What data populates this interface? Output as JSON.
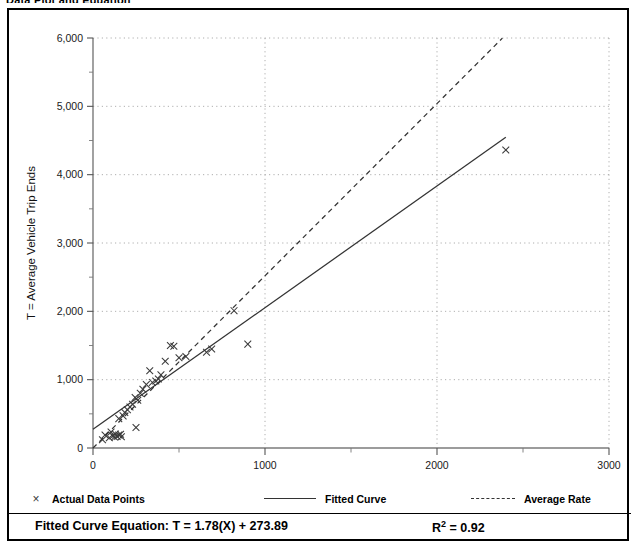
{
  "page": {
    "top_caption": "Data Plot and Equation"
  },
  "legend": {
    "entries": [
      {
        "label": "Actual Data Points",
        "style": "marker",
        "glyph": "×",
        "color": "#3a3a3a"
      },
      {
        "label": "Fitted Curve",
        "style": "solid",
        "color": "#333333"
      },
      {
        "label": "Average Rate",
        "style": "dashed",
        "color": "#333333"
      }
    ]
  },
  "equation": {
    "text": "Fitted Curve Equation:  T = 1.78(X) + 273.89",
    "r_squared_symbol": "R",
    "r_squared_exponent": "2",
    "r_squared_value": "= 0.92"
  },
  "chart_data": {
    "type": "scatter",
    "title": "",
    "xlabel": "X = Number of Persons",
    "ylabel": "T = Average Vehicle Trip Ends",
    "xlim": [
      0,
      3000
    ],
    "ylim": [
      0,
      6000
    ],
    "xticks": [
      0,
      1000,
      2000,
      3000
    ],
    "xticklabels": [
      "0",
      "1000",
      "2000",
      "3000"
    ],
    "xminorticks": [
      500,
      1500,
      2500
    ],
    "yticks": [
      0,
      1000,
      2000,
      3000,
      4000,
      5000,
      6000
    ],
    "yticklabels": [
      "0",
      "1,000",
      "2,000",
      "3,000",
      "4,000",
      "5,000",
      "6,000"
    ],
    "yminorticks": [
      500,
      1500,
      2500,
      3500,
      4500,
      5500
    ],
    "grid": true,
    "grid_style": "dotted",
    "legend_position": "below-plot",
    "series": [
      {
        "name": "Actual Data Points",
        "type": "scatter",
        "marker": "x",
        "color": "#3a3a3a",
        "points": [
          [
            55,
            120
          ],
          [
            70,
            190
          ],
          [
            95,
            150
          ],
          [
            105,
            235
          ],
          [
            115,
            175
          ],
          [
            125,
            160
          ],
          [
            130,
            205
          ],
          [
            140,
            170
          ],
          [
            150,
            190
          ],
          [
            150,
            430
          ],
          [
            160,
            200
          ],
          [
            165,
            165
          ],
          [
            175,
            470
          ],
          [
            185,
            520
          ],
          [
            200,
            560
          ],
          [
            215,
            600
          ],
          [
            230,
            640
          ],
          [
            245,
            740
          ],
          [
            250,
            300
          ],
          [
            260,
            700
          ],
          [
            275,
            800
          ],
          [
            290,
            860
          ],
          [
            310,
            930
          ],
          [
            330,
            1130
          ],
          [
            345,
            960
          ],
          [
            365,
            980
          ],
          [
            380,
            1010
          ],
          [
            395,
            1070
          ],
          [
            420,
            1270
          ],
          [
            450,
            1500
          ],
          [
            470,
            1490
          ],
          [
            500,
            1320
          ],
          [
            540,
            1340
          ],
          [
            660,
            1400
          ],
          [
            690,
            1450
          ],
          [
            820,
            2010
          ],
          [
            900,
            1520
          ],
          [
            2400,
            4360
          ]
        ]
      },
      {
        "name": "Fitted Curve",
        "type": "line",
        "style": "solid",
        "color": "#333333",
        "equation": "T = 1.78(X) + 273.89",
        "slope": 1.78,
        "intercept": 273.89,
        "r_squared": 0.92,
        "x_range": [
          0,
          2400
        ]
      },
      {
        "name": "Average Rate",
        "type": "line",
        "style": "dashed",
        "color": "#333333",
        "slope": 2.52,
        "intercept": 0,
        "x_range": [
          0,
          2380
        ]
      }
    ]
  }
}
